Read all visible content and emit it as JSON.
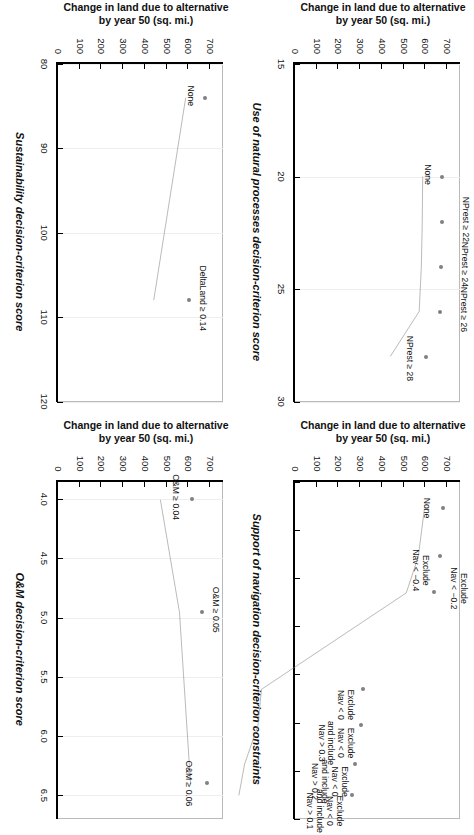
{
  "figure": {
    "rotation_note": "figure rotated 90 degrees clockwise in the frame",
    "line_color": "#808080",
    "marker_color": "#808080",
    "axis_color": "#000000",
    "grid_color": "#eeeeee"
  },
  "shared": {
    "y_axis_title_line1": "Change in land due to alternative",
    "y_axis_title_line2": "by year 50 (sq. mi.)",
    "y_ticks": [
      0,
      100,
      200,
      300,
      400,
      500,
      600,
      700
    ],
    "y_tick_labels": [
      "0",
      "100",
      "200",
      "300",
      "400",
      "500",
      "600",
      "700"
    ],
    "ylim": [
      0,
      760
    ]
  },
  "chart_data": [
    {
      "id": "natural-processes",
      "type": "line",
      "panel_position": "top-left-in-frame",
      "title": "",
      "xlabel": "Use of natural processes decision-criterion score",
      "ylabel": "Change in land due to alternative by year 50 (sq. mi.)",
      "xlim": [
        15,
        30
      ],
      "ylim": [
        0,
        760
      ],
      "x_ticks": [
        15,
        20,
        25,
        30
      ],
      "x_tick_labels": [
        "15",
        "20",
        "25",
        "30"
      ],
      "y_ticks": [
        0,
        100,
        200,
        300,
        400,
        500,
        600,
        700
      ],
      "y_tick_labels": [
        "0",
        "100",
        "200",
        "300",
        "400",
        "500",
        "600",
        "700"
      ],
      "grid": true,
      "points": [
        {
          "label": "None",
          "x": 20.0,
          "y": 676
        },
        {
          "label": "NPrest ≥ 22",
          "x": 22.0,
          "y": 675
        },
        {
          "label": "NPrest ≥ 24",
          "x": 24.0,
          "y": 673
        },
        {
          "label": "NPrest ≥ 26",
          "x": 26.0,
          "y": 668
        },
        {
          "label": "NPrest ≥ 28",
          "x": 28.0,
          "y": 603
        }
      ]
    },
    {
      "id": "navigation",
      "type": "line",
      "panel_position": "top-right-in-frame",
      "title": "Support of navigation decision-criterion constraints",
      "xlabel": "",
      "ylabel": "Change in land due to alternative by year 50 (sq. mi.)",
      "xlim": [
        0,
        7
      ],
      "ylim": [
        0,
        760
      ],
      "x_ticks": [
        0,
        1,
        2,
        3,
        4,
        5,
        6,
        7
      ],
      "x_tick_labels": [
        "",
        "",
        "",
        "",
        "",
        "",
        "",
        ""
      ],
      "y_ticks": [
        0,
        100,
        200,
        300,
        400,
        500,
        600,
        700
      ],
      "y_tick_labels": [
        "0",
        "100",
        "200",
        "300",
        "400",
        "500",
        "600",
        "700"
      ],
      "grid": true,
      "points": [
        {
          "label": "None",
          "x": 0.55,
          "y": 680
        },
        {
          "label": "Exclude\nNav < −0.4",
          "x": 1.55,
          "y": 666
        },
        {
          "label": "Exclude\nNav < −0.2",
          "x": 2.3,
          "y": 639
        },
        {
          "label": "Exclude\nNav < 0",
          "x": 4.3,
          "y": 313
        },
        {
          "label": "Exclude\nNav < 0\nand include\nNav > 0.3",
          "x": 5.05,
          "y": 305
        },
        {
          "label": "Exclude\nNav < 0\nand include\nNav > 0.2",
          "x": 5.85,
          "y": 275
        },
        {
          "label": "Exclude\nNav < 0\nand include\nNav > 0.1",
          "x": 6.5,
          "y": 262
        }
      ]
    },
    {
      "id": "sustainability",
      "type": "line",
      "panel_position": "bottom-left-in-frame",
      "title": "",
      "xlabel": "Sustainability decision-criterion score",
      "ylabel": "Change in land due to alternative by year 50 (sq. mi.)",
      "xlim": [
        80,
        120
      ],
      "ylim": [
        0,
        760
      ],
      "x_ticks": [
        80,
        90,
        100,
        110,
        120
      ],
      "x_tick_labels": [
        "80",
        "90",
        "100",
        "110",
        "120"
      ],
      "y_ticks": [
        0,
        100,
        200,
        300,
        400,
        500,
        600,
        700
      ],
      "y_tick_labels": [
        "0",
        "100",
        "200",
        "300",
        "400",
        "500",
        "600",
        "700"
      ],
      "grid": true,
      "points": [
        {
          "label": "None",
          "x": 84.0,
          "y": 676
        },
        {
          "label": "DeltaLand ≥ 0.14",
          "x": 108.0,
          "y": 604
        }
      ]
    },
    {
      "id": "om",
      "type": "line",
      "panel_position": "bottom-right-in-frame",
      "title": "",
      "xlabel": "O&M decision-criterion score",
      "ylabel": "Change in land due to alternative by year 50 (sq. mi.)",
      "xlim": [
        3.85,
        6.7
      ],
      "ylim": [
        0,
        760
      ],
      "x_ticks": [
        4.0,
        4.5,
        5.0,
        5.5,
        6.0,
        6.5
      ],
      "x_tick_labels": [
        "4.0",
        "4.5",
        "5.0",
        "5.5",
        "6.0",
        "6.5"
      ],
      "y_ticks": [
        0,
        100,
        200,
        300,
        400,
        500,
        600,
        700
      ],
      "y_tick_labels": [
        "0",
        "100",
        "200",
        "300",
        "400",
        "500",
        "600",
        "700"
      ],
      "grid": true,
      "points": [
        {
          "label": "O&M ≥ 0.04",
          "x": 4.0,
          "y": 619
        },
        {
          "label": "O&M ≥ 0.05",
          "x": 4.95,
          "y": 662
        },
        {
          "label": "O&M ≥ 0.06",
          "x": 6.4,
          "y": 687
        }
      ]
    }
  ]
}
